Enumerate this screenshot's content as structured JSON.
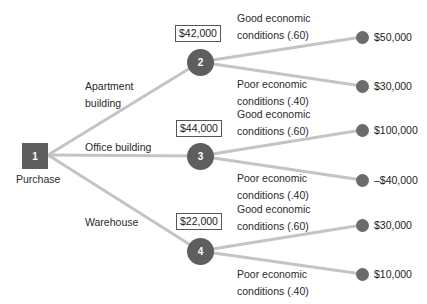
{
  "diagram": {
    "type": "decision-tree",
    "colors": {
      "node": "#5e5e5e",
      "edge": "#c2c2c2",
      "text": "#222222"
    },
    "root": {
      "id": "1",
      "label": "Purchase"
    },
    "alternatives": [
      {
        "label_line1": "Apartment",
        "label_line2": "building",
        "node_id": "2",
        "expected_value": "$42,000",
        "outcomes": [
          {
            "label_line1": "Good economic",
            "label_line2": "conditions (.60)",
            "payoff": "$50,000"
          },
          {
            "label_line1": "Poor economic",
            "label_line2": "conditions (.40)",
            "payoff": "$30,000"
          }
        ]
      },
      {
        "label_line1": "Office building",
        "node_id": "3",
        "expected_value": "$44,000",
        "outcomes": [
          {
            "label_line1": "Good economic",
            "label_line2": "conditions (.60)",
            "payoff": "$100,000"
          },
          {
            "label_line1": "Poor economic",
            "label_line2": "conditions (.40)",
            "payoff": "–$40,000"
          }
        ]
      },
      {
        "label_line1": "Warehouse",
        "node_id": "4",
        "expected_value": "$22,000",
        "outcomes": [
          {
            "label_line1": "Good economic",
            "label_line2": "conditions (.60)",
            "payoff": "$30,000"
          },
          {
            "label_line1": "Poor economic",
            "label_line2": "conditions (.40)",
            "payoff": "$10,000"
          }
        ]
      }
    ]
  }
}
